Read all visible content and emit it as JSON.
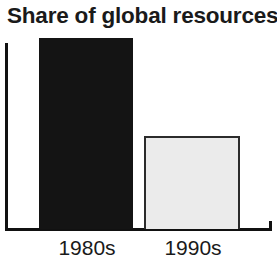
{
  "chart_data": {
    "type": "bar",
    "title": "Share of global resources",
    "subtitle": "",
    "xlabel": "",
    "ylabel": "",
    "categories": [
      "1980s",
      "1990s"
    ],
    "values": [
      100,
      48.7
    ],
    "value_unit": "relative share (%)",
    "ylim": [
      0,
      100
    ],
    "grid": false,
    "legend": null,
    "legend_position": "none",
    "annotations": [],
    "axis": {
      "y_axis_visible": true,
      "x_axis_visible": true,
      "tick_labels_y": [],
      "tick_labels_x": [
        "1980s",
        "1990s"
      ],
      "x_axis_end_tick": true
    },
    "series": [
      {
        "name": "Share of global resources",
        "values": [
          100,
          48.7
        ],
        "bar_styles": [
          {
            "category": "1980s",
            "fill": "#141414",
            "border": "#141414",
            "style": "solid-dark"
          },
          {
            "category": "1990s",
            "fill": "#ebebeb",
            "border": "#2b2b2b",
            "style": "light-outlined"
          }
        ]
      }
    ]
  },
  "colors": {
    "background": "#ffffff",
    "axis": "#111111",
    "text": "#1a1a1a",
    "bar_dark": "#141414",
    "bar_light_fill": "#ebebeb",
    "bar_light_border": "#2b2b2b"
  }
}
